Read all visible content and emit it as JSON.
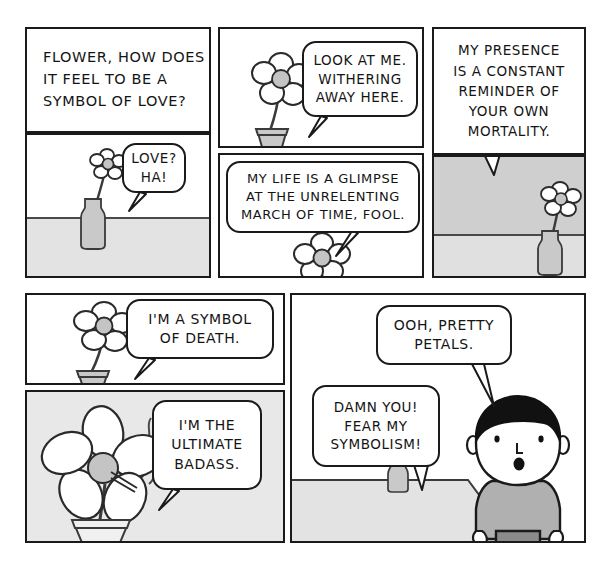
{
  "comic": {
    "title": "Flower - Symbol of Love",
    "palette": {
      "ink": "#1a1a1a",
      "paper": "#ffffff",
      "floor_gray": "#e3e3e3",
      "wall_gray": "#cfcfcf",
      "panel_gray": "#e8e8e8",
      "flower_center": "#c4c4c4",
      "vase_gray": "#c9c9c9",
      "shirt_gray": "#b0b0b0",
      "pants_gray": "#8a8a8a",
      "hair_black": "#111111"
    },
    "panels": [
      {
        "id": "panel-1-question",
        "row": 1,
        "col": 1,
        "kind": "caption-and-scene",
        "caption_lines": [
          "FLOWER, HOW DOES",
          "IT FEEL TO BE A",
          "SYMBOL OF LOVE?"
        ],
        "bubble_lines": [
          "LOVE?",
          "HA!"
        ],
        "scene": "small flower in bottle vase on table"
      },
      {
        "id": "panel-2-withering",
        "row": 1,
        "col": 2,
        "kind": "scene",
        "bubble_lines": [
          "LOOK AT ME.",
          "WITHERING",
          "AWAY HERE."
        ],
        "scene": "flower in pot, white background"
      },
      {
        "id": "panel-3-glimpse",
        "row": 2,
        "col": 2,
        "kind": "scene",
        "bubble_lines": [
          "MY LIFE IS A GLIMPSE",
          "AT THE UNRELENTING",
          "MARCH OF TIME, FOOL."
        ],
        "scene": "flower centered, white background"
      },
      {
        "id": "panel-4-mortality",
        "row": 1,
        "col": 3,
        "kind": "caption-and-scene",
        "caption_lines": [
          "MY PRESENCE",
          "IS A CONSTANT",
          "REMINDER OF",
          "YOUR OWN",
          "MORTALITY."
        ],
        "scene": "flower in bottle vase, gray wall and gray floor"
      },
      {
        "id": "panel-5-death",
        "row": 3,
        "col": 1,
        "kind": "scene",
        "bubble_lines": [
          "I'M A SYMBOL",
          "OF DEATH."
        ],
        "scene": "flower in flowerpot, white background"
      },
      {
        "id": "panel-6-badass",
        "row": 4,
        "col": 1,
        "kind": "scene",
        "bubble_lines": [
          "I'M THE",
          "ULTIMATE",
          "BADASS."
        ],
        "scene": "big flower in pot smoking a cigarette, gray background"
      },
      {
        "id": "panel-7-petals",
        "row": 3,
        "col": 2,
        "kind": "scene",
        "bubble_lines_person": [
          "OOH, PRETTY",
          "PETALS."
        ],
        "bubble_lines_flower": [
          "DAMN YOU!",
          "FEAR MY",
          "SYMBOLISM!"
        ],
        "scene": "man looking at flower in bottle vase on table"
      }
    ]
  }
}
